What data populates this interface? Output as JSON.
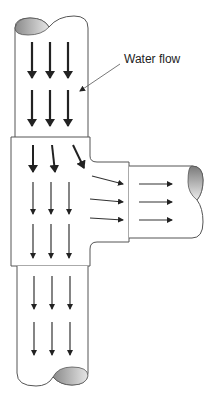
{
  "diagram": {
    "annotation": {
      "label": "Water flow",
      "x": 124,
      "y": 52
    },
    "colors": {
      "outline": "#444444",
      "arrow": "#222222",
      "pipe_end_dark": "#7a7a7a",
      "pipe_end_light": "#e0e0e0",
      "background": "#ffffff"
    },
    "components": [
      "top-pipe",
      "tee-body",
      "side-branch-pipe",
      "bottom-pipe"
    ],
    "flow_arrows": {
      "top_pipe": 6,
      "tee_down": 9,
      "tee_turning": 3,
      "side_pipe": 3,
      "bottom_pipe": 6
    }
  }
}
